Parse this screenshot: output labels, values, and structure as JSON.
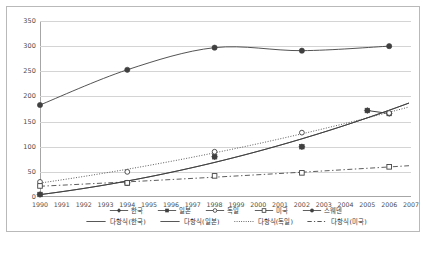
{
  "chart_data": {
    "type": "line",
    "title": "",
    "xlabel": "",
    "ylabel": "",
    "xlim": [
      1990,
      2007
    ],
    "ylim": [
      0,
      350
    ],
    "grid": true,
    "legend_position": "bottom",
    "x_ticks": [
      "1990",
      "1991",
      "1992",
      "1993",
      "1994",
      "1995",
      "1996",
      "1997",
      "1998",
      "1999",
      "2000",
      "2001",
      "2002",
      "2003",
      "2004",
      "2005",
      "2006",
      "2007"
    ],
    "y_ticks": [
      "0",
      "50",
      "100",
      "150",
      "200",
      "250",
      "300",
      "350"
    ],
    "series": [
      {
        "name": "한국",
        "marker": "filled-diamond",
        "points": [
          {
            "x": 1990,
            "y": 5
          },
          {
            "x": 1994,
            "y": 28
          },
          {
            "x": 1998,
            "y": 80
          },
          {
            "x": 2002,
            "y": 100
          },
          {
            "x": 2005,
            "y": 172
          },
          {
            "x": 2006,
            "y": 166
          }
        ]
      },
      {
        "name": "일본",
        "marker": "filled-square",
        "points": [
          {
            "x": 1990,
            "y": 5
          },
          {
            "x": 1994,
            "y": 28
          },
          {
            "x": 1998,
            "y": 80
          },
          {
            "x": 2002,
            "y": 100
          },
          {
            "x": 2005,
            "y": 172
          },
          {
            "x": 2006,
            "y": 166
          }
        ]
      },
      {
        "name": "독일",
        "marker": "open-circle",
        "points": [
          {
            "x": 1990,
            "y": 30
          },
          {
            "x": 1994,
            "y": 50
          },
          {
            "x": 1998,
            "y": 90
          },
          {
            "x": 2002,
            "y": 128
          },
          {
            "x": 2006,
            "y": 167
          }
        ]
      },
      {
        "name": "미국",
        "marker": "open-square",
        "points": [
          {
            "x": 1990,
            "y": 22
          },
          {
            "x": 1994,
            "y": 28
          },
          {
            "x": 1998,
            "y": 42
          },
          {
            "x": 2002,
            "y": 48
          },
          {
            "x": 2006,
            "y": 60
          }
        ]
      },
      {
        "name": "스웨덴",
        "marker": "filled-circle",
        "points": [
          {
            "x": 1990,
            "y": 183
          },
          {
            "x": 1994,
            "y": 253
          },
          {
            "x": 1998,
            "y": 297
          },
          {
            "x": 2002,
            "y": 291
          },
          {
            "x": 2006,
            "y": 300
          }
        ]
      }
    ],
    "trendlines": [
      {
        "name": "다항식(한국)",
        "style": "solid"
      },
      {
        "name": "다항식(일본)",
        "style": "solid"
      },
      {
        "name": "다항식(독일)",
        "style": "dotted"
      },
      {
        "name": "다항식(미국)",
        "style": "dashed"
      }
    ]
  },
  "legend": {
    "row1": [
      {
        "label": "한국"
      },
      {
        "label": "일본"
      },
      {
        "label": "독일"
      },
      {
        "label": "미국"
      },
      {
        "label": "스웨덴"
      }
    ],
    "row2": [
      {
        "label": "다항식(한국)"
      },
      {
        "label": "다항식(일본)"
      },
      {
        "label": "다항식(독일)"
      },
      {
        "label": "다항식(미국)"
      }
    ]
  },
  "colors": {
    "frame": "#b9b9b9",
    "grid": "#d4d4d4",
    "axis": "#a6a6a6",
    "series": "#404040",
    "text": "#4d4d4d"
  }
}
